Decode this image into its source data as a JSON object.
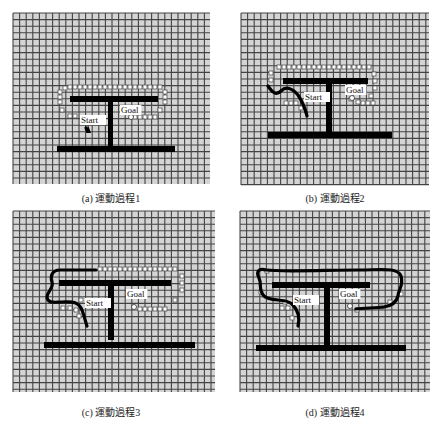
{
  "figure": {
    "panels": [
      {
        "id": "a",
        "caption": "(a) 運動過程1",
        "grid": {
          "x": 13,
          "y": 13,
          "w": 197,
          "h": 171,
          "cell": 6.6
        },
        "caption_pos": {
          "x": 111,
          "y": 190
        },
        "obstacles": [
          {
            "x": 70,
            "y": 96,
            "w": 88,
            "h": 6
          },
          {
            "x": 108,
            "y": 96,
            "w": 5,
            "h": 54
          },
          {
            "x": 57,
            "y": 146,
            "w": 118,
            "h": 6
          }
        ],
        "labels": [
          {
            "text": "Start",
            "x": 81,
            "y": 123
          },
          {
            "text": "Goal",
            "x": 121,
            "y": 113
          }
        ],
        "goal_marker": {
          "x": 131,
          "y": 117
        },
        "start_marker": {
          "x": 87,
          "y": 126
        },
        "path": "M86,128 L87,130",
        "robot": {
          "x": 88,
          "y": 128
        },
        "sensor_points": [
          [
            65,
            88
          ],
          [
            70,
            87
          ],
          [
            75,
            87
          ],
          [
            80,
            87
          ],
          [
            85,
            87
          ],
          [
            90,
            87
          ],
          [
            95,
            87
          ],
          [
            100,
            87
          ],
          [
            105,
            87
          ],
          [
            110,
            87
          ],
          [
            115,
            87
          ],
          [
            120,
            87
          ],
          [
            125,
            87
          ],
          [
            130,
            87
          ],
          [
            135,
            87
          ],
          [
            140,
            87
          ],
          [
            145,
            87
          ],
          [
            150,
            87
          ],
          [
            155,
            87
          ],
          [
            160,
            87
          ],
          [
            60,
            92
          ],
          [
            60,
            97
          ],
          [
            60,
            102
          ],
          [
            62,
            110
          ],
          [
            70,
            116
          ],
          [
            75,
            116
          ],
          [
            84,
            120
          ],
          [
            165,
            92
          ],
          [
            165,
            97
          ],
          [
            165,
            102
          ],
          [
            160,
            110
          ],
          [
            135,
            117
          ],
          [
            140,
            117
          ],
          [
            145,
            117
          ],
          [
            150,
            117
          ],
          [
            155,
            117
          ]
        ]
      },
      {
        "id": "b",
        "caption": "(b) 運動過程2",
        "grid": {
          "x": 241,
          "y": 13,
          "w": 188,
          "h": 172,
          "cell": 6.6
        },
        "caption_pos": {
          "x": 335,
          "y": 190
        },
        "obstacles": [
          {
            "x": 283,
            "y": 78,
            "w": 85,
            "h": 6
          },
          {
            "x": 326,
            "y": 78,
            "w": 6,
            "h": 58
          },
          {
            "x": 268,
            "y": 132,
            "w": 124,
            "h": 6
          }
        ],
        "labels": [
          {
            "text": "Start",
            "x": 305,
            "y": 100
          },
          {
            "text": "Goal",
            "x": 346,
            "y": 93
          }
        ],
        "goal_marker": {
          "x": 352,
          "y": 98
        },
        "start_marker": {
          "x": 300,
          "y": 106
        },
        "path": "M268,86 C272,92 276,96 281,91 C286,86 292,88 298,95 C302,101 305,108 307,116",
        "robot": null,
        "sensor_points": [
          [
            279,
            67
          ],
          [
            284,
            67
          ],
          [
            289,
            67
          ],
          [
            294,
            67
          ],
          [
            299,
            67
          ],
          [
            304,
            67
          ],
          [
            309,
            67
          ],
          [
            314,
            67
          ],
          [
            319,
            67
          ],
          [
            324,
            67
          ],
          [
            329,
            67
          ],
          [
            334,
            67
          ],
          [
            339,
            67
          ],
          [
            344,
            67
          ],
          [
            349,
            67
          ],
          [
            354,
            67
          ],
          [
            359,
            67
          ],
          [
            364,
            67
          ],
          [
            369,
            67
          ],
          [
            271,
            73
          ],
          [
            271,
            80
          ],
          [
            286,
            103
          ],
          [
            291,
            103
          ],
          [
            296,
            103
          ],
          [
            301,
            108
          ],
          [
            374,
            74
          ],
          [
            375,
            81
          ],
          [
            375,
            88
          ],
          [
            371,
            96
          ],
          [
            358,
            102
          ],
          [
            363,
            103
          ],
          [
            368,
            103
          ],
          [
            373,
            103
          ],
          [
            351,
            99
          ]
        ]
      },
      {
        "id": "c",
        "caption": "(c) 運動過程3",
        "grid": {
          "x": 13,
          "y": 211,
          "w": 202,
          "h": 181,
          "cell": 6.6
        },
        "caption_pos": {
          "x": 111,
          "y": 404
        },
        "obstacles": [
          {
            "x": 59,
            "y": 280,
            "w": 112,
            "h": 6
          },
          {
            "x": 108,
            "y": 280,
            "w": 6,
            "h": 60
          },
          {
            "x": 44,
            "y": 342,
            "w": 151,
            "h": 6
          }
        ],
        "labels": [
          {
            "text": "Start",
            "x": 86,
            "y": 306
          },
          {
            "text": "Goal",
            "x": 127,
            "y": 297
          }
        ],
        "goal_marker": {
          "x": 134,
          "y": 307
        },
        "start_marker": {
          "x": 80,
          "y": 311
        },
        "path": "M96,270 L60,270 C52,270 50,276 52,282 C54,288 47,292 47,297 C47,304 56,302 62,302 C70,302 78,300 82,310 C85,318 86,324 87,326",
        "robot": null,
        "sensor_points": [
          [
            100,
            269
          ],
          [
            105,
            269
          ],
          [
            110,
            269
          ],
          [
            115,
            269
          ],
          [
            120,
            269
          ],
          [
            125,
            269
          ],
          [
            130,
            269
          ],
          [
            135,
            269
          ],
          [
            140,
            269
          ],
          [
            145,
            269
          ],
          [
            150,
            269
          ],
          [
            155,
            269
          ],
          [
            160,
            269
          ],
          [
            165,
            269
          ],
          [
            170,
            269
          ],
          [
            175,
            269
          ],
          [
            182,
            276
          ],
          [
            182,
            283
          ],
          [
            182,
            290
          ],
          [
            175,
            300
          ],
          [
            140,
            309
          ],
          [
            145,
            309
          ],
          [
            150,
            309
          ],
          [
            155,
            309
          ],
          [
            160,
            309
          ],
          [
            165,
            309
          ],
          [
            63,
            308
          ],
          [
            70,
            308
          ],
          [
            76,
            310
          ],
          [
            79,
            316
          ],
          [
            81,
            300
          ]
        ]
      },
      {
        "id": "d",
        "caption": "(d) 運動過程4",
        "grid": {
          "x": 240,
          "y": 211,
          "w": 190,
          "h": 181,
          "cell": 6.6
        },
        "caption_pos": {
          "x": 335,
          "y": 404
        },
        "obstacles": [
          {
            "x": 272,
            "y": 282,
            "w": 98,
            "h": 6
          },
          {
            "x": 324,
            "y": 282,
            "w": 6,
            "h": 64
          },
          {
            "x": 256,
            "y": 345,
            "w": 150,
            "h": 6
          }
        ],
        "labels": [
          {
            "text": "Start",
            "x": 294,
            "y": 303
          },
          {
            "text": "Goal",
            "x": 340,
            "y": 297
          }
        ],
        "goal_marker": {
          "x": 350,
          "y": 306
        },
        "start_marker": {
          "x": 290,
          "y": 306
        },
        "path": "M298,326 C300,318 298,310 292,304 C286,298 270,302 264,296 C258,290 262,284 259,278 C256,272 258,268 266,270 C280,272 330,270 360,270 C380,270 398,267 401,276 C404,286 398,290 398,296 C396,304 390,306 384,307 C376,308 364,308 356,309",
        "robot": null,
        "sensor_points": [
          [
            267,
            271
          ],
          [
            261,
            292
          ],
          [
            282,
            308
          ],
          [
            288,
            308
          ],
          [
            285,
            302
          ],
          [
            292,
            318
          ],
          [
            357,
            310
          ],
          [
            381,
            307
          ],
          [
            390,
            302
          ],
          [
            401,
            294
          ],
          [
            296,
            302
          ]
        ]
      }
    ],
    "colors": {
      "grid_bg": "#d4d4d4",
      "grid_line": "#2a2a2a",
      "obstacle": "#000000",
      "path": "#000000",
      "sensor_fill": "#ffffff",
      "sensor_stroke": "#555555",
      "label_bg": "#ffffff"
    }
  }
}
